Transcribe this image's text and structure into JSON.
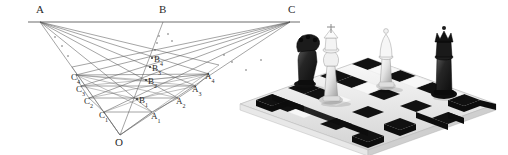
{
  "figure": {
    "background_color": "#ffffff",
    "line_color": "#5a5a5a",
    "text_color": "#2b2b2b",
    "width": 508,
    "height": 155
  },
  "diagram": {
    "name": "perspective-grid-diagram",
    "horizon_label": "horizon line",
    "vanishing_points": [
      {
        "id": "A",
        "label": "A",
        "x": 40,
        "y": 22,
        "label_x": 36,
        "label_y": 4
      },
      {
        "id": "B",
        "label": "B",
        "x": 163,
        "y": 22,
        "label_x": 159,
        "label_y": 4
      },
      {
        "id": "C",
        "label": "C",
        "x": 290,
        "y": 22,
        "label_x": 288,
        "label_y": 4
      }
    ],
    "station_point": {
      "id": "O",
      "label": "O",
      "x": 120,
      "y": 135,
      "label_x": 115,
      "label_y": 137
    },
    "points_a": [
      {
        "label": "A",
        "sub": "1",
        "x": 152,
        "y": 112,
        "label_x": 151,
        "label_y": 112
      },
      {
        "label": "A",
        "sub": "2",
        "x": 178,
        "y": 98,
        "label_x": 176,
        "label_y": 97
      },
      {
        "label": "A",
        "sub": "3",
        "x": 195,
        "y": 86,
        "label_x": 192,
        "label_y": 85
      },
      {
        "label": "A",
        "sub": "4",
        "x": 208,
        "y": 74,
        "label_x": 205,
        "label_y": 72
      }
    ],
    "points_b": [
      {
        "label": "B",
        "sub": "1",
        "x": 137,
        "y": 99,
        "label_x": 139,
        "label_y": 96
      },
      {
        "label": "B",
        "sub": "2",
        "x": 146,
        "y": 80,
        "label_x": 148,
        "label_y": 77
      },
      {
        "label": "B",
        "sub": "3",
        "x": 150,
        "y": 67,
        "label_x": 152,
        "label_y": 64
      },
      {
        "label": "B",
        "sub": "4",
        "x": 152,
        "y": 58,
        "label_x": 154,
        "label_y": 55
      }
    ],
    "points_c": [
      {
        "label": "C",
        "sub": "1",
        "x": 104,
        "y": 112,
        "label_x": 99,
        "label_y": 111
      },
      {
        "label": "C",
        "sub": "2",
        "x": 89,
        "y": 98,
        "label_x": 84,
        "label_y": 97
      },
      {
        "label": "C",
        "sub": "3",
        "x": 81,
        "y": 86,
        "label_x": 76,
        "label_y": 85
      },
      {
        "label": "C",
        "sub": "4",
        "x": 76,
        "y": 75,
        "label_x": 71,
        "label_y": 73
      }
    ]
  },
  "chessboard": {
    "name": "chessboard-render",
    "board_squares": 8,
    "dark_square_color": "#111111",
    "light_square_color": "#f4f4f4",
    "pieces": [
      {
        "name": "dark-knight",
        "side": "dark"
      },
      {
        "name": "light-king",
        "side": "light"
      },
      {
        "name": "light-bishop",
        "side": "light"
      },
      {
        "name": "dark-queen",
        "side": "dark"
      }
    ]
  }
}
